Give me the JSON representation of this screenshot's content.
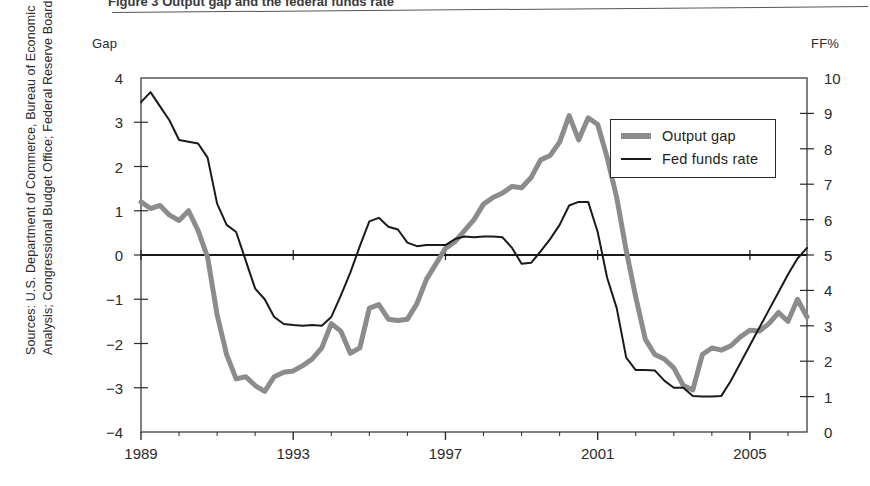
{
  "figure": {
    "top_caption": "Figure 3  Output gap and the federal funds rate",
    "sources_note": "Sources: U.S. Department of Commerce, Bureau of Economic\nAnalysis; Congressional Budget Office; Federal Reserve Board"
  },
  "legend": {
    "items": [
      {
        "label": "Output gap",
        "style": "thick-gray",
        "color": "#8c8c8c"
      },
      {
        "label": "Fed funds rate",
        "style": "thin-black",
        "color": "#1a1a1a"
      }
    ]
  },
  "chart_data": {
    "type": "line",
    "title": "",
    "xlabel": "",
    "ylabel": "Gap",
    "y2label": "FF%",
    "xlim": [
      1989.0,
      2006.5
    ],
    "ylim": [
      -4,
      4
    ],
    "y2lim": [
      0,
      10
    ],
    "grid": false,
    "legend_position": "upper-right-inside",
    "axes": {
      "left_axis_title": "Gap",
      "right_axis_title": "FF%",
      "left_ticks": [
        4,
        3,
        2,
        1,
        0,
        -1,
        -2,
        -3,
        -4
      ],
      "left_tick_labels": [
        "4",
        "3",
        "2",
        "1",
        "0",
        "-1",
        "-2",
        "-3",
        "-4"
      ],
      "right_ticks": [
        10,
        9,
        8,
        7,
        6,
        5,
        4,
        3,
        2,
        1,
        0
      ],
      "right_tick_labels": [
        "10",
        "9",
        "8",
        "7",
        "6",
        "5",
        "4",
        "3",
        "2",
        "1",
        "0"
      ],
      "x_ticks": [
        1989,
        1993,
        1997,
        2001,
        2005
      ],
      "x_tick_labels": [
        "1989",
        "1993",
        "1997",
        "2001",
        "2005"
      ],
      "x_minor_tick_interval": 1,
      "zero_line": 0
    },
    "series": [
      {
        "name": "Output gap",
        "axis": "left",
        "color": "#8c8c8c",
        "line_width": 5,
        "x": [
          1989.0,
          1989.25,
          1989.5,
          1989.75,
          1990.0,
          1990.25,
          1990.5,
          1990.75,
          1991.0,
          1991.25,
          1991.5,
          1991.75,
          1992.0,
          1992.25,
          1992.5,
          1992.75,
          1993.0,
          1993.25,
          1993.5,
          1993.75,
          1994.0,
          1994.25,
          1994.5,
          1994.75,
          1995.0,
          1995.25,
          1995.5,
          1995.75,
          1996.0,
          1996.25,
          1996.5,
          1996.75,
          1997.0,
          1997.25,
          1997.5,
          1997.75,
          1998.0,
          1998.25,
          1998.5,
          1998.75,
          1999.0,
          1999.25,
          1999.5,
          1999.75,
          2000.0,
          2000.25,
          2000.5,
          2000.75,
          2001.0,
          2001.25,
          2001.5,
          2001.75,
          2002.0,
          2002.25,
          2002.5,
          2002.75,
          2003.0,
          2003.25,
          2003.5,
          2003.75,
          2004.0,
          2004.25,
          2004.5,
          2004.75,
          2005.0,
          2005.25,
          2005.5,
          2005.75,
          2006.0,
          2006.25,
          2006.5
        ],
        "y": [
          1.2,
          1.05,
          1.12,
          0.9,
          0.78,
          1.0,
          0.55,
          -0.05,
          -1.35,
          -2.25,
          -2.8,
          -2.75,
          -2.95,
          -3.08,
          -2.75,
          -2.65,
          -2.62,
          -2.5,
          -2.35,
          -2.1,
          -1.55,
          -1.72,
          -2.22,
          -2.1,
          -1.2,
          -1.12,
          -1.45,
          -1.48,
          -1.45,
          -1.1,
          -0.55,
          -0.2,
          0.15,
          0.3,
          0.55,
          0.8,
          1.15,
          1.3,
          1.4,
          1.55,
          1.52,
          1.75,
          2.15,
          2.25,
          2.55,
          3.15,
          2.6,
          3.1,
          2.95,
          2.2,
          1.3,
          0.1,
          -0.95,
          -1.9,
          -2.25,
          -2.35,
          -2.55,
          -2.95,
          -3.05,
          -2.25,
          -2.1,
          -2.15,
          -2.05,
          -1.85,
          -1.7,
          -1.72,
          -1.55,
          -1.3,
          -1.5,
          -1.0,
          -1.4
        ]
      },
      {
        "name": "Fed funds rate",
        "axis": "right",
        "color": "#1a1a1a",
        "line_width": 2,
        "x": [
          1989.0,
          1989.25,
          1989.5,
          1989.75,
          1990.0,
          1990.25,
          1990.5,
          1990.75,
          1991.0,
          1991.25,
          1991.5,
          1991.75,
          1992.0,
          1992.25,
          1992.5,
          1992.75,
          1993.0,
          1993.25,
          1993.5,
          1993.75,
          1994.0,
          1994.25,
          1994.5,
          1994.75,
          1995.0,
          1995.25,
          1995.5,
          1995.75,
          1996.0,
          1996.25,
          1996.5,
          1996.75,
          1997.0,
          1997.25,
          1997.5,
          1997.75,
          1998.0,
          1998.25,
          1998.5,
          1998.75,
          1999.0,
          1999.25,
          1999.5,
          1999.75,
          2000.0,
          2000.25,
          2000.5,
          2000.75,
          2001.0,
          2001.25,
          2001.5,
          2001.75,
          2002.0,
          2002.25,
          2002.5,
          2002.75,
          2003.0,
          2003.25,
          2003.5,
          2003.75,
          2004.0,
          2004.25,
          2004.5,
          2004.75,
          2005.0,
          2005.25,
          2005.5,
          2005.75,
          2006.0,
          2006.25,
          2006.5
        ],
        "y": [
          9.32,
          9.6,
          9.2,
          8.8,
          8.25,
          8.2,
          8.15,
          7.75,
          6.45,
          5.85,
          5.65,
          4.85,
          4.05,
          3.75,
          3.25,
          3.05,
          3.02,
          3.0,
          3.02,
          3.0,
          3.25,
          3.85,
          4.5,
          5.25,
          5.95,
          6.05,
          5.8,
          5.72,
          5.35,
          5.25,
          5.28,
          5.28,
          5.28,
          5.45,
          5.52,
          5.5,
          5.52,
          5.52,
          5.5,
          5.2,
          4.75,
          4.78,
          5.1,
          5.45,
          5.85,
          6.4,
          6.5,
          6.5,
          5.65,
          4.35,
          3.5,
          2.1,
          1.75,
          1.75,
          1.74,
          1.45,
          1.25,
          1.25,
          1.02,
          1.0,
          1.0,
          1.02,
          1.45,
          1.95,
          2.45,
          2.95,
          3.45,
          3.95,
          4.45,
          4.9,
          5.2
        ]
      }
    ]
  }
}
